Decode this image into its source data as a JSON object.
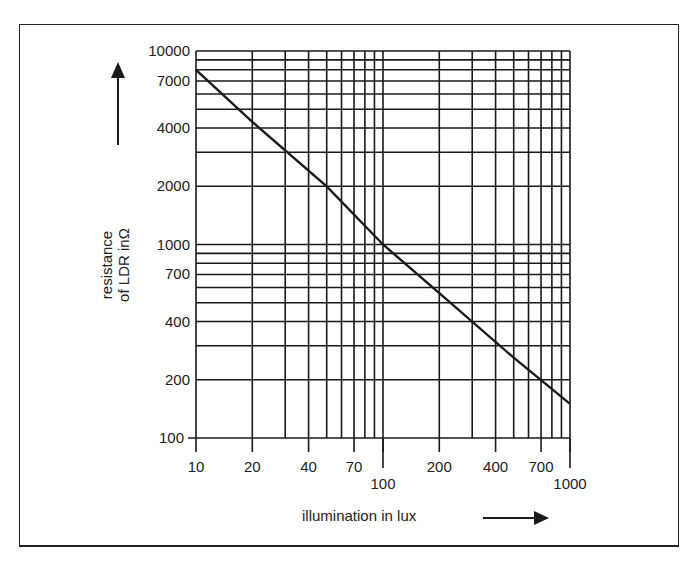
{
  "chart_data": {
    "type": "line",
    "title": "",
    "xlabel": "illumination in lux",
    "ylabel_line1": "resistance",
    "ylabel_line2": "of LDR inΩ",
    "x_scale": "log",
    "y_scale": "log",
    "xlim": [
      10,
      1000
    ],
    "ylim": [
      100,
      10000
    ],
    "grid": true,
    "legend": "none",
    "x_tick_labels": [
      {
        "value": 10,
        "label": "10",
        "offset": false
      },
      {
        "value": 20,
        "label": "20",
        "offset": false
      },
      {
        "value": 40,
        "label": "40",
        "offset": false
      },
      {
        "value": 70,
        "label": "70",
        "offset": false
      },
      {
        "value": 100,
        "label": "100",
        "offset": true
      },
      {
        "value": 200,
        "label": "200",
        "offset": false
      },
      {
        "value": 400,
        "label": "400",
        "offset": false
      },
      {
        "value": 700,
        "label": "700",
        "offset": false
      },
      {
        "value": 1000,
        "label": "1000",
        "offset": true
      }
    ],
    "x_gridlines": [
      10,
      20,
      30,
      40,
      50,
      60,
      70,
      80,
      90,
      100,
      200,
      300,
      400,
      500,
      600,
      700,
      800,
      900,
      1000
    ],
    "y_tick_labels": [
      {
        "value": 10000,
        "label": "10000"
      },
      {
        "value": 7000,
        "label": "7000"
      },
      {
        "value": 4000,
        "label": "4000"
      },
      {
        "value": 2000,
        "label": "2000"
      },
      {
        "value": 1000,
        "label": "1000"
      },
      {
        "value": 700,
        "label": "700"
      },
      {
        "value": 400,
        "label": "400"
      },
      {
        "value": 200,
        "label": "200"
      },
      {
        "value": 100,
        "label": "100"
      }
    ],
    "y_gridlines": [
      100,
      200,
      300,
      400,
      500,
      600,
      700,
      800,
      900,
      1000,
      2000,
      3000,
      4000,
      5000,
      6000,
      7000,
      8000,
      9000,
      10000
    ],
    "series": [
      {
        "name": "LDR resistance",
        "x": [
          10,
          20,
          50,
          100,
          200,
          500,
          1000
        ],
        "y": [
          8000,
          4300,
          2000,
          1000,
          560,
          260,
          150
        ]
      }
    ]
  },
  "colors": {
    "ink": "#1a1a1a",
    "background": "#ffffff"
  },
  "layout": {
    "plot_left": 196,
    "plot_right": 570,
    "plot_top": 51,
    "plot_bottom": 438
  }
}
